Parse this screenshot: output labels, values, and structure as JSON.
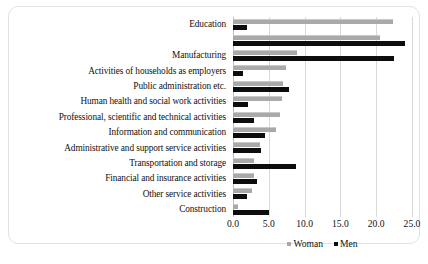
{
  "chart_data": {
    "type": "bar",
    "orientation": "horizontal",
    "title": "",
    "xlabel": "",
    "ylabel": "",
    "xlim": [
      0.0,
      25.0
    ],
    "xticks": [
      "0.0",
      "5.0",
      "10.0",
      "15.0",
      "20.0",
      "25.0"
    ],
    "xtick_values": [
      0.0,
      5.0,
      10.0,
      15.0,
      20.0,
      25.0
    ],
    "grid": "vertical",
    "legend_position": "bottom-center",
    "categories": [
      "Education",
      "",
      "Manufacturing",
      "Activities of households as employers",
      "Public administration etc.",
      "Human health and social work activities",
      "Professional, scientific and technical activities",
      "Information and communication",
      "Administrative and support service activities",
      "Transportation and storage",
      "Financial and insurance activities",
      "Other service activities",
      "Construction"
    ],
    "series": [
      {
        "name": "Woman",
        "color": "#a9a9a9",
        "values": [
          22.3,
          20.6,
          9.0,
          7.4,
          7.0,
          6.9,
          6.5,
          6.0,
          3.8,
          2.9,
          2.9,
          2.6,
          0.7
        ]
      },
      {
        "name": "Men",
        "color": "#0d0d0d",
        "values": [
          2.0,
          24.0,
          22.5,
          1.4,
          7.8,
          2.1,
          3.0,
          4.4,
          3.9,
          8.8,
          3.4,
          2.0,
          5.0
        ]
      }
    ]
  },
  "legend": {
    "entries": [
      {
        "label": "Woman",
        "swatch": "woman"
      },
      {
        "label": "Men",
        "swatch": "men"
      }
    ]
  },
  "caption": {
    "fragment": ""
  }
}
